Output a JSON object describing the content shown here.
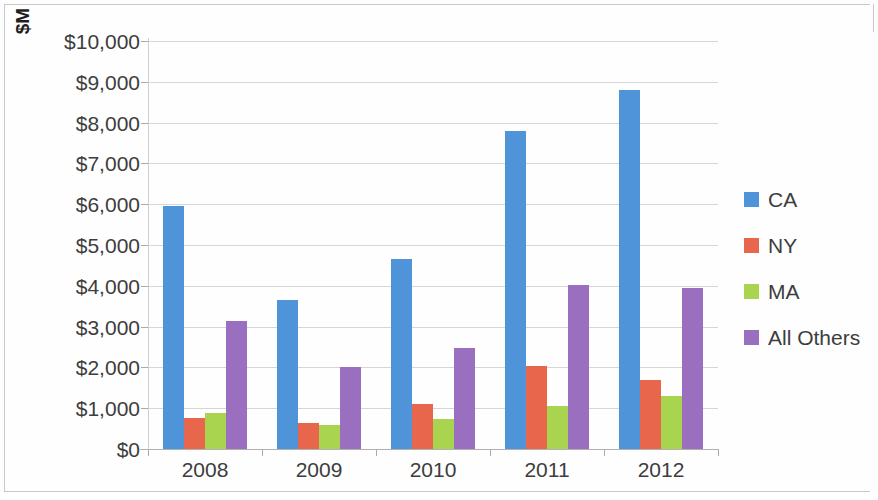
{
  "chart_data": {
    "type": "bar",
    "title": "",
    "subtitle": "",
    "xlabel": "",
    "ylabel": "$M",
    "categories": [
      "2008",
      "2009",
      "2010",
      "2011",
      "2012"
    ],
    "series": [
      {
        "name": "CA",
        "color": "#4F94D8",
        "values": [
          5950,
          3650,
          4650,
          7800,
          8800
        ]
      },
      {
        "name": "NY",
        "color": "#E8664B",
        "values": [
          750,
          640,
          1100,
          2030,
          1700
        ]
      },
      {
        "name": "MA",
        "color": "#A9D450",
        "values": [
          880,
          590,
          730,
          1050,
          1300
        ]
      },
      {
        "name": "All Others",
        "color": "#9A6FC0",
        "values": [
          3130,
          2010,
          2470,
          4020,
          3950
        ]
      }
    ],
    "ylim": [
      0,
      10000
    ],
    "ytick_step": 1000,
    "ytick_labels": [
      "$0",
      "$1,000",
      "$2,000",
      "$3,000",
      "$4,000",
      "$5,000",
      "$6,000",
      "$7,000",
      "$8,000",
      "$9,000",
      "$10,000"
    ],
    "grid": true,
    "legend_position": "right"
  },
  "legend": {
    "items": [
      {
        "label": "CA"
      },
      {
        "label": "NY"
      },
      {
        "label": "MA"
      },
      {
        "label": "All Others"
      }
    ]
  }
}
